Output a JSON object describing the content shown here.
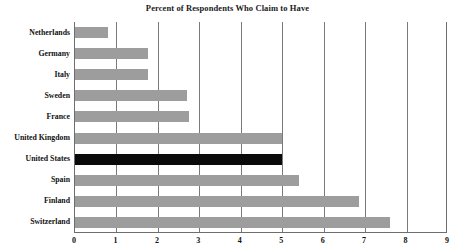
{
  "chart_data": {
    "type": "bar",
    "orientation": "horizontal",
    "title": "Percent of Respondents Who Claim to Have",
    "xlabel": "",
    "ylabel": "",
    "xlim": [
      0,
      9
    ],
    "xticks": [
      "0",
      "1",
      "2",
      "3",
      "4",
      "5",
      "6",
      "7",
      "8",
      "9"
    ],
    "grid": "vertical",
    "legend": "none",
    "categories": [
      "Netherlands",
      "Germany",
      "Italy",
      "Sweden",
      "France",
      "United Kingdom",
      "United States",
      "Spain",
      "Finland",
      "Switzerland"
    ],
    "values": [
      0.8,
      1.75,
      1.75,
      2.7,
      2.75,
      5.0,
      5.0,
      5.4,
      6.85,
      7.6
    ],
    "highlight_category": "United States",
    "colors": {
      "bar": "#9d9d9d",
      "highlight_bar": "#0a0a0a",
      "axis": "#6e6e6e",
      "gridline": "#7a7a7a",
      "text": "#111111",
      "background": "#ffffff"
    }
  }
}
